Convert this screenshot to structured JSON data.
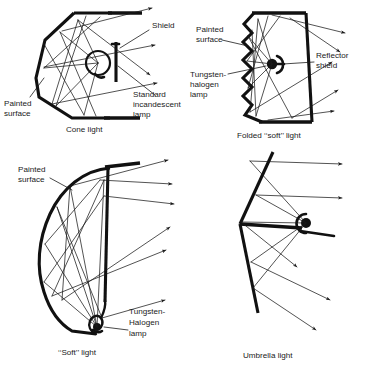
{
  "figure": {
    "background_color": "#ffffff",
    "ink_color": "#111111",
    "panels": [
      {
        "id": "cone-light",
        "caption": "Cone light",
        "labels": [
          {
            "id": "shield",
            "text": "Shield"
          },
          {
            "id": "painted-surface",
            "text_line1": "Painted",
            "text_line2": "surface"
          },
          {
            "id": "lamp",
            "text_line1": "Standard",
            "text_line2": "incandescent",
            "text_line3": "lamp"
          }
        ]
      },
      {
        "id": "folded-soft-light",
        "caption": "Folded ‘‘soft’’ light",
        "labels": [
          {
            "id": "painted-surface",
            "text_line1": "Painted",
            "text_line2": "surface"
          },
          {
            "id": "lamp",
            "text_line1": "Tungsten-",
            "text_line2": "halogen",
            "text_line3": "lamp"
          },
          {
            "id": "reflector-shield",
            "text_line1": "Reflector",
            "text_line2": "shield"
          }
        ]
      },
      {
        "id": "soft-light",
        "caption": "‘‘Soft’’ light",
        "labels": [
          {
            "id": "painted-surface",
            "text_line1": "Painted",
            "text_line2": "surface"
          },
          {
            "id": "lamp",
            "text_line1": "Tungsten-",
            "text_line2": "Halogen",
            "text_line3": "lamp"
          }
        ]
      },
      {
        "id": "umbrella-light",
        "caption": "Umbrella light",
        "labels": []
      }
    ]
  }
}
